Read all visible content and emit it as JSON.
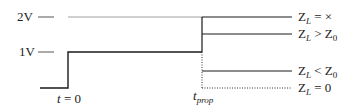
{
  "y_axis": {
    "ticks": [
      {
        "label": "2V",
        "value": 2
      },
      {
        "label": "1V",
        "value": 1
      }
    ]
  },
  "x_axis": {
    "markers": [
      {
        "label": "t = 0",
        "var": "t",
        "rest": " = 0"
      },
      {
        "label": "t_prop",
        "var": "t",
        "sub": "prop"
      }
    ]
  },
  "cases": [
    {
      "label": "Z_L = ×",
      "z": "Z",
      "zsub": "L",
      "rel": " = ×",
      "rhs": "",
      "rhs_sub": "",
      "level": "2V"
    },
    {
      "label": "Z_L > Z_0",
      "z": "Z",
      "zsub": "L",
      "rel": " > ",
      "rhs": "Z",
      "rhs_sub": "0",
      "level": "between 1V and 2V"
    },
    {
      "label": "Z_L < Z_0",
      "z": "Z",
      "zsub": "L",
      "rel": " < ",
      "rhs": "Z",
      "rhs_sub": "0",
      "level": "between 0 and 1V"
    },
    {
      "label": "Z_L = 0",
      "z": "Z",
      "zsub": "L",
      "rel": " = 0",
      "rhs": "",
      "rhs_sub": "",
      "level": "0"
    }
  ],
  "colors": {
    "line": "#1a1a1a",
    "guide": "#555555"
  }
}
